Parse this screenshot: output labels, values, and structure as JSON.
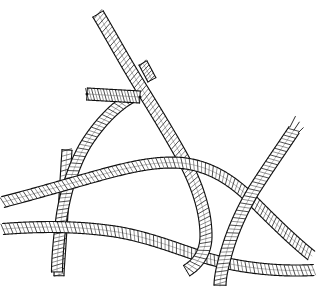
{
  "figure": {
    "title": "Intersecting hatched ribbon bands",
    "medium": "pen-and-ink line drawing",
    "background_color": "#ffffff",
    "ink_color": "#111111",
    "hatch_color": "#222222",
    "width": 320,
    "height": 288,
    "band_count": 6,
    "stub_count": 2
  },
  "bands": [
    {
      "id": "band-vertical-descending",
      "name": "long curved band from top to lower-left",
      "description": "Starts at the top edge near x=98,y=13, curves down and to the right through the middle, then bends back down-left, exiting at the bottom near x=185,y=272",
      "start_point": [
        98,
        13
      ],
      "end_point": [
        186,
        272
      ],
      "width_px": 12,
      "hatch_spacing_px": 4,
      "layer": 3,
      "path": "M 98 14 C 110 34 124 60 140 86 C 156 112 172 138 186 164 C 198 188 206 212 206 236 C 206 252 198 264 186 271",
      "end_cap": "flat"
    },
    {
      "id": "band-left-arc",
      "name": "arcing band from upper-middle down to lower-left",
      "description": "Rises from the lower-left area, arcs up to its apex near x=100,y=100 and meets the descending band around x=130,y=96",
      "start_point": [
        130,
        96
      ],
      "end_point": [
        62,
        272
      ],
      "width_px": 11,
      "hatch_spacing_px": 4,
      "layer": 2,
      "path": "M 132 97 C 116 106 100 122 86 144 C 74 164 66 190 62 214 C 59 236 57 258 57 272",
      "end_cap": "flat"
    },
    {
      "id": "band-vertical-straight",
      "name": "straight vertical band lower-left",
      "description": "Narrow straight vertical band running from about y=150 down past the bottom edge near x=60",
      "start_point": [
        66,
        150
      ],
      "end_point": [
        58,
        276
      ],
      "width_px": 10,
      "hatch_spacing_px": 5,
      "layer": 1,
      "path": "M 67 150 C 65 180 63 214 61 244 C 60 260 59 270 59 276",
      "end_cap": "flat"
    },
    {
      "id": "band-upper-horizontal",
      "name": "upper horizontal sweeping band",
      "description": "Enters at the left edge near y=200, sweeps right and slightly up to the crest near x=160,y=160, then descends to the right toward the X crossing near x=250,y=215",
      "start_point": [
        2,
        201
      ],
      "end_point": [
        312,
        258
      ],
      "width_px": 11,
      "hatch_spacing_px": 4,
      "layer": 4,
      "path": "M 3 202 C 34 194 68 184 104 174 C 134 166 158 161 182 163 C 210 166 232 180 252 200 C 272 220 292 240 312 256",
      "end_cap": "open"
    },
    {
      "id": "band-lower-horizontal",
      "name": "lower horizontal sweeping band",
      "description": "Enters at the left edge near y=228, runs right and gently downward, crossing under the X and exiting at the right edge near y=266",
      "start_point": [
        2,
        228
      ],
      "end_point": [
        314,
        272
      ],
      "width_px": 11,
      "hatch_spacing_px": 4,
      "layer": 2,
      "path": "M 3 229 C 40 226 80 226 118 232 C 152 238 180 250 206 258 C 240 268 278 272 314 270",
      "end_cap": "open"
    },
    {
      "id": "band-right-diagonal",
      "name": "right diagonal band with frayed tip",
      "description": "Runs from a split frayed tip at upper right near x=296,y=128 down-left through the X crossing and exits at the bottom near x=222,y=286",
      "start_point": [
        296,
        128
      ],
      "end_point": [
        222,
        286
      ],
      "width_px": 12,
      "hatch_spacing_px": 4,
      "layer": 5,
      "path": "M 294 130 C 282 148 268 168 254 190 C 242 210 232 232 226 254 C 222 268 220 278 220 286",
      "end_cap": "frayed",
      "fray_strands": 3
    }
  ],
  "stubs": [
    {
      "id": "stub-horizontal-mid",
      "name": "short horizontal hatched stub at mid-upper area",
      "description": "A short horizontal hatched strap crossing the descending band, with a small knot dot at each end",
      "start_point": [
        86,
        94
      ],
      "end_point": [
        140,
        97
      ],
      "width_px": 12,
      "hatch_spacing_px": 3,
      "path": "M 87 94 L 140 97",
      "has_end_dots": true
    },
    {
      "id": "stub-flap-upper",
      "name": "small folded flap above the descending band",
      "description": "A tiny folded ribbon flap attached on the right side of the descending band near the top",
      "start_point": [
        142,
        62
      ],
      "end_point": [
        156,
        82
      ],
      "width_px": 9,
      "hatch_spacing_px": 3,
      "path": "M 143 63 L 152 80"
    }
  ],
  "crossings": [
    {
      "id": "crossing-upper-junction",
      "name": "upper junction where the arc meets the descending band",
      "location": [
        131,
        96
      ],
      "type": "tangent-meet"
    },
    {
      "id": "crossing-left-over-under",
      "name": "vertical band crosses both horizontal bands on the left",
      "location": [
        64,
        208
      ],
      "type": "over-under"
    },
    {
      "id": "crossing-middle",
      "name": "descending band crosses the upper horizontal band",
      "location": [
        196,
        196
      ],
      "type": "over-under"
    },
    {
      "id": "crossing-x-right",
      "name": "X crossing at lower right where the right diagonal meets the horizontal bands",
      "location": [
        248,
        232
      ],
      "type": "x-cross"
    },
    {
      "id": "crossing-v-bottom",
      "name": "V junction at the bottom where the descending band turns",
      "location": [
        190,
        270
      ],
      "type": "v-turn"
    }
  ],
  "colors": {
    "background": "#ffffff",
    "ink": "#111111",
    "hatch": "#222222",
    "hatch_light": "#4a4a4a"
  }
}
